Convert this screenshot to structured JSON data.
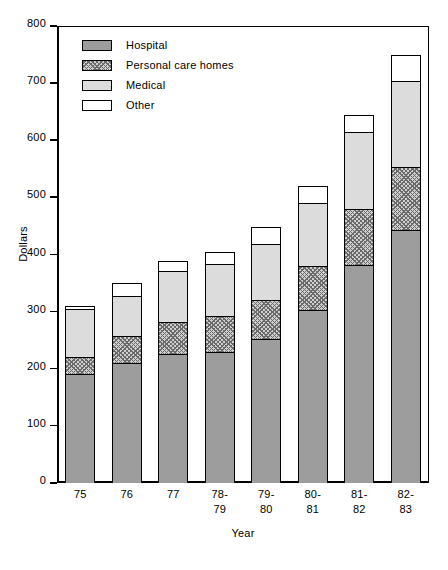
{
  "chart_data": {
    "type": "bar",
    "subtype": "stacked-bar",
    "title": "",
    "xlabel": "Year",
    "ylabel": "Dollars",
    "ylim": [
      0,
      800
    ],
    "yticks": [
      0,
      100,
      200,
      300,
      400,
      500,
      600,
      700,
      800
    ],
    "ytick_labels": [
      "0",
      "100",
      "200",
      "300",
      "400",
      "500",
      "600",
      "700",
      "800"
    ],
    "grid": false,
    "legend_position": "upper-left-inside",
    "categories": [
      "75",
      "76",
      "77",
      "78-\n79",
      "79-\n80",
      "80-\n81",
      "81-\n82",
      "82-\n83"
    ],
    "category_labels_flat": [
      "75",
      "76",
      "77",
      "78-79",
      "79-80",
      "80-81",
      "81-82",
      "82-83"
    ],
    "series": [
      {
        "name": "Hospital",
        "fill": "solid-gray",
        "color": "#9d9d9d",
        "values": [
          190,
          210,
          225,
          230,
          252,
          302,
          382,
          443
        ]
      },
      {
        "name": "Personal care homes",
        "fill": "cross-hatch",
        "color": "#cfcfcf",
        "values": [
          30,
          48,
          57,
          63,
          68,
          78,
          97,
          110
        ]
      },
      {
        "name": "Medical",
        "fill": "light-gray",
        "color": "#dcdcdc",
        "values": [
          85,
          70,
          90,
          90,
          98,
          110,
          136,
          150
        ]
      },
      {
        "name": "Other",
        "fill": "white",
        "color": "#ffffff",
        "values": [
          5,
          23,
          16,
          22,
          30,
          30,
          30,
          47
        ]
      }
    ],
    "totals": [
      310,
      351,
      388,
      405,
      448,
      520,
      645,
      750
    ]
  },
  "legend": {
    "items": [
      {
        "label": "Hospital"
      },
      {
        "label": "Personal care homes"
      },
      {
        "label": "Medical"
      },
      {
        "label": "Other"
      }
    ]
  },
  "axes": {
    "y_title": "Dollars",
    "x_title": "Year"
  }
}
